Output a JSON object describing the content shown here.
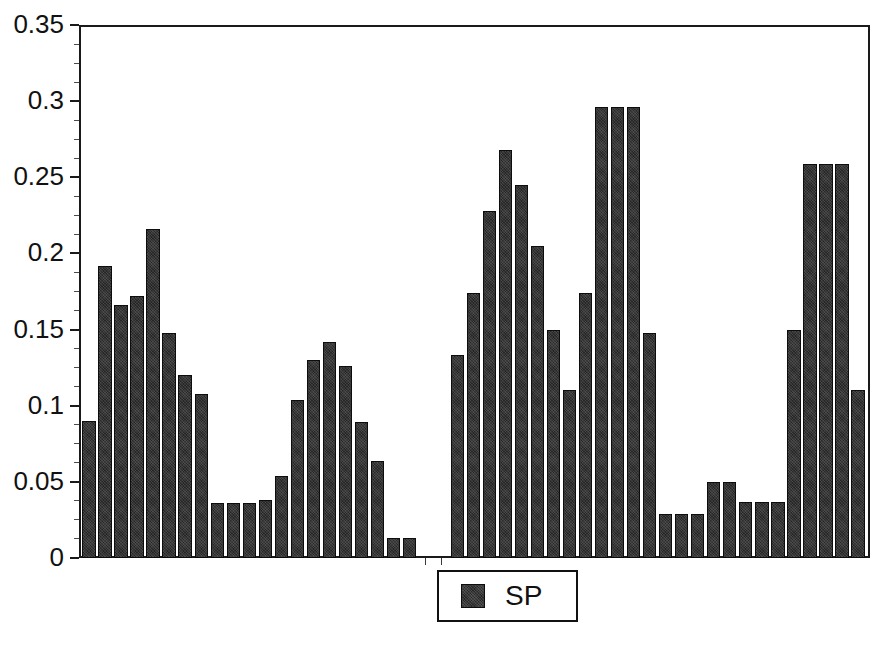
{
  "chart_data": {
    "type": "bar",
    "title": "",
    "xlabel": "",
    "ylabel": "",
    "ylim": [
      0,
      0.35
    ],
    "ytick_values": [
      0,
      0.05,
      0.1,
      0.15,
      0.2,
      0.25,
      0.3,
      0.35
    ],
    "ytick_labels": [
      "0",
      "0.05",
      "0.1",
      "0.15",
      "0.2",
      "0.25",
      "0.3",
      "0.35"
    ],
    "yminor_step": 0.0125,
    "grid": false,
    "legend": {
      "position": "bottom-center",
      "entries": [
        {
          "name": "SP",
          "color": "#262626"
        }
      ]
    },
    "series": [
      {
        "name": "SP",
        "color": "#262626",
        "values": [
          0.09,
          0.192,
          0.166,
          0.172,
          0.216,
          0.148,
          0.12,
          0.108,
          0.036,
          0.036,
          0.036,
          0.038,
          0.054,
          0.104,
          0.13,
          0.142,
          0.126,
          0.089,
          0.064,
          0.013,
          0.013,
          0.0,
          0.0,
          0.133,
          0.174,
          0.228,
          0.268,
          0.245,
          0.205,
          0.15,
          0.11,
          0.174,
          0.296,
          0.296,
          0.296,
          0.148,
          0.029,
          0.029,
          0.029,
          0.05,
          0.05,
          0.037,
          0.037,
          0.037,
          0.15,
          0.259,
          0.259,
          0.259,
          0.11
        ]
      }
    ],
    "n_bars": 49,
    "bar_face_color": "#262626",
    "bar_edge_color": "#0d0d0d",
    "axis_color": "#1a1a1a",
    "background_color": "#ffffff"
  }
}
